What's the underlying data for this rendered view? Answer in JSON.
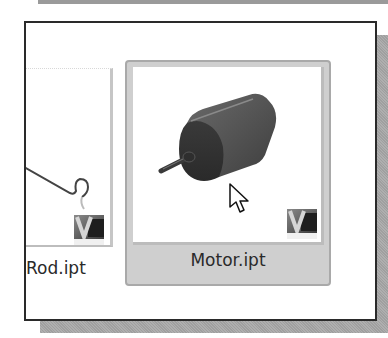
{
  "window": {
    "type": "file-browser-thumbnail-view"
  },
  "files": [
    {
      "name": "Rod.ipt",
      "selected": false,
      "thumbnail": "rod-part-preview",
      "badge_icon": "inventor-part-icon"
    },
    {
      "name": "Motor.ipt",
      "selected": true,
      "thumbnail": "motor-part-preview",
      "badge_icon": "inventor-part-icon"
    }
  ],
  "cursor": {
    "icon": "arrow-pointer-icon",
    "hovering": "Motor.ipt"
  },
  "colors": {
    "frame_border": "#2a2a2a",
    "selected_tile_bg": "#cfcfcf",
    "selected_tile_border": "#a9a9a9",
    "shadow": "#a8a8a8",
    "label_text": "#2a2a2a",
    "motor_body": "#4a4a4a"
  }
}
